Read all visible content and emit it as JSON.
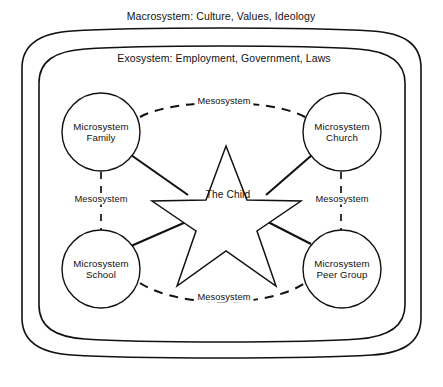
{
  "diagram": {
    "title_band": "Macrosystem: Culture, Values, Ideology",
    "exosystem_band": "Exosystem: Employment, Government, Laws",
    "center": {
      "label": "The Child",
      "shape": "five-pointed-star"
    },
    "microsystems": [
      {
        "id": "family",
        "line1": "Microsystem",
        "line2": "Family",
        "label": "Microsystem\nFamily"
      },
      {
        "id": "church",
        "line1": "Microsystem",
        "line2": "Church",
        "label": "Microsystem\nChurch"
      },
      {
        "id": "school",
        "line1": "Microsystem",
        "line2": "School",
        "label": "Microsystem\nSchool"
      },
      {
        "id": "peer-group",
        "line1": "Microsystem",
        "line2": "Peer Group",
        "label": "Microsystem\nPeer Group"
      }
    ],
    "mesosystem_links": [
      {
        "id": "top",
        "label": "Mesosystem",
        "connects": "family-church"
      },
      {
        "id": "left",
        "label": "Mesosystem",
        "connects": "family-school"
      },
      {
        "id": "right",
        "label": "Mesosystem",
        "connects": "church-peer-group"
      },
      {
        "id": "bottom",
        "label": "Mesosystem",
        "connects": "school-peer-group"
      }
    ],
    "colors": {
      "stroke": "#111111",
      "background": "#ffffff"
    }
  }
}
